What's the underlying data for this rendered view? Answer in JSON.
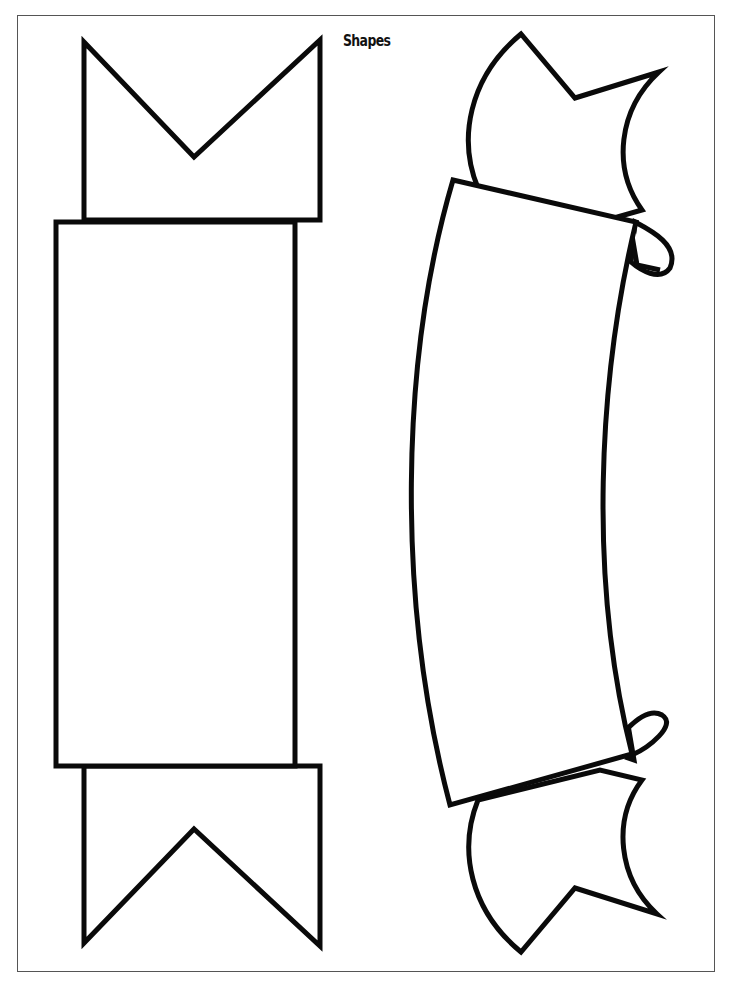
{
  "page": {
    "title": "Shapes"
  },
  "shapes": [
    {
      "name": "straight-ribbon-banner",
      "parts": [
        "top-tail-notched",
        "center-rectangle",
        "bottom-tail-notched"
      ]
    },
    {
      "name": "curved-scroll-banner",
      "parts": [
        "top-flag",
        "top-curl",
        "curved-panel",
        "bottom-curl",
        "bottom-flag"
      ]
    }
  ],
  "colors": {
    "stroke": "#0a0a0a",
    "fill": "#ffffff",
    "frame": "#555555"
  }
}
